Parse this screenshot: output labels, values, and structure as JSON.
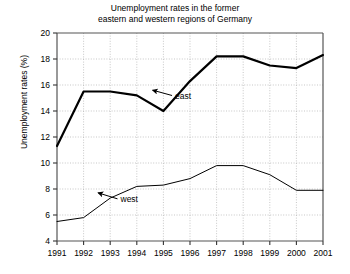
{
  "chart_data": {
    "type": "line",
    "title": "Unemployment rates in the former\neastern and western regions of Germany",
    "xlabel": "",
    "ylabel": "Unemployment rates (%)",
    "categories": [
      "1991",
      "1992",
      "1993",
      "1994",
      "1995",
      "1996",
      "1997",
      "1998",
      "1999",
      "2000",
      "2001"
    ],
    "x": [
      1991,
      1992,
      1993,
      1994,
      1995,
      1996,
      1997,
      1998,
      1999,
      2000,
      2001
    ],
    "xlim": [
      1991,
      2001
    ],
    "ylim": [
      4,
      20
    ],
    "yticks": [
      4,
      6,
      8,
      10,
      12,
      14,
      16,
      18,
      20
    ],
    "ytick_labels": [
      "4",
      "6",
      "8",
      "10",
      "12",
      "14",
      "16",
      "18",
      "20"
    ],
    "grid": true,
    "grid_style": "dotted",
    "legend": "none",
    "series": [
      {
        "name": "east",
        "values": [
          11.3,
          15.5,
          15.5,
          15.2,
          14.0,
          16.3,
          18.2,
          18.2,
          17.5,
          17.3,
          18.3
        ],
        "line_width": "thick",
        "color": "#000000"
      },
      {
        "name": "west",
        "values": [
          5.5,
          5.8,
          7.3,
          8.2,
          8.3,
          8.8,
          9.8,
          9.8,
          9.1,
          7.9,
          7.9
        ],
        "line_width": "thin",
        "color": "#000000"
      }
    ],
    "annotations": [
      {
        "text": "east",
        "label_x": 1995.4,
        "label_y": 15.0,
        "point_x": 1994.6,
        "point_y": 15.6
      },
      {
        "text": "west",
        "label_x": 1993.35,
        "label_y": 7.05,
        "point_x": 1992.55,
        "point_y": 7.7
      }
    ]
  }
}
